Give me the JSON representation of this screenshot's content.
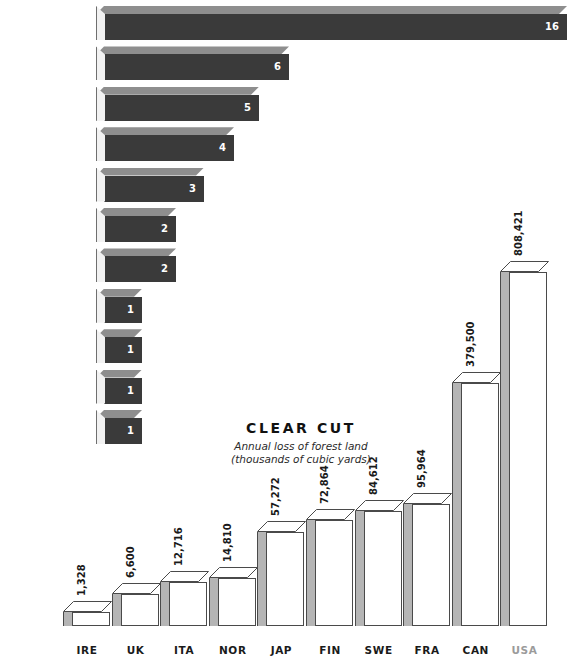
{
  "title": {
    "main": "CLEAR CUT",
    "subtitle_line1": "Annual loss of forest land",
    "subtitle_line2": "(thousands of cubic yards)"
  },
  "colors": {
    "bar_dark": "#3a3a3a",
    "bar_top": "#8e8e8e",
    "bar_light": "#f2f2f2",
    "outline": "#4a4a4a",
    "side_grey": "#b5b5b5",
    "text": "#1a1a1a",
    "text_muted": "#9b9b9b",
    "background": "#ffffff"
  },
  "chart_data": [
    {
      "type": "bar",
      "orientation": "horizontal",
      "title": "CLEAR CUT",
      "subtitle": "Annual loss of forest land (thousands of cubic yards)",
      "xlabel": "",
      "ylabel": "",
      "grid": false,
      "legend": "none",
      "note": "per-capita style ranking, values shown as whole numbers on each bar",
      "categories": [
        "United States",
        "France",
        "United Kingdom",
        "Japan",
        "Greece",
        "Canada",
        "Sweden",
        "Finland",
        "Germany",
        "Ireland",
        "Portugal"
      ],
      "values": [
        16,
        6,
        5,
        4,
        3,
        2,
        2,
        1,
        1,
        1,
        1
      ],
      "value_labels": [
        "16",
        "6",
        "5",
        "4",
        "3",
        "2",
        "2",
        "1",
        "1",
        "1",
        "1"
      ],
      "highlighted": [
        "United States"
      ]
    },
    {
      "type": "bar",
      "orientation": "vertical",
      "title": "",
      "xlabel": "",
      "ylabel": "",
      "grid": false,
      "legend": "none",
      "categories": [
        "IRE",
        "UK",
        "ITA",
        "NOR",
        "JAP",
        "FIN",
        "SWE",
        "FRA",
        "CAN",
        "USA"
      ],
      "values": [
        1328,
        6600,
        12716,
        14810,
        57272,
        72864,
        84612,
        95964,
        379500,
        808421
      ],
      "value_labels": [
        "1,328",
        "6,600",
        "12,716",
        "14,810",
        "57,272",
        "72,864",
        "84,612",
        "95,964",
        "379,500",
        "808,421"
      ],
      "highlighted": [
        "USA"
      ]
    }
  ],
  "hbars": [
    {
      "label": "United States",
      "value_label": "16",
      "muted": true
    },
    {
      "label": "France",
      "value_label": "6",
      "muted": false
    },
    {
      "label": "United Kingdom",
      "value_label": "5",
      "muted": false
    },
    {
      "label": "Japan",
      "value_label": "4",
      "muted": false
    },
    {
      "label": "Greece",
      "value_label": "3",
      "muted": false
    },
    {
      "label": "Canada",
      "value_label": "2",
      "muted": false
    },
    {
      "label": "Sweden",
      "value_label": "2",
      "muted": false
    },
    {
      "label": "Finland",
      "value_label": "1",
      "muted": false
    },
    {
      "label": "Germany",
      "value_label": "1",
      "muted": false
    },
    {
      "label": "Ireland",
      "value_label": "1",
      "muted": false
    },
    {
      "label": "Portugal",
      "value_label": "1",
      "muted": false
    }
  ],
  "vbars": [
    {
      "name": "IRE",
      "value_label": "1,328",
      "muted": false
    },
    {
      "name": "UK",
      "value_label": "6,600",
      "muted": false
    },
    {
      "name": "ITA",
      "value_label": "12,716",
      "muted": false
    },
    {
      "name": "NOR",
      "value_label": "14,810",
      "muted": false
    },
    {
      "name": "JAP",
      "value_label": "57,272",
      "muted": false
    },
    {
      "name": "FIN",
      "value_label": "72,864",
      "muted": false
    },
    {
      "name": "SWE",
      "value_label": "84,612",
      "muted": false
    },
    {
      "name": "FRA",
      "value_label": "95,964",
      "muted": false
    },
    {
      "name": "CAN",
      "value_label": "379,500",
      "muted": false
    },
    {
      "name": "USA",
      "value_label": "808,421",
      "muted": true
    }
  ]
}
